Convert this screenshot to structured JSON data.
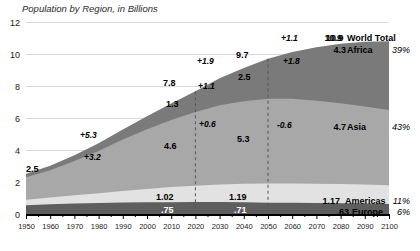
{
  "chart_data": {
    "type": "area",
    "title": "Population by Region, in Billions",
    "xlabel": "",
    "ylabel": "",
    "ylim": [
      0,
      12
    ],
    "xlim": [
      1950,
      2100
    ],
    "grid": true,
    "stacked": true,
    "legend_position": "right",
    "x": [
      1950,
      1960,
      1970,
      1980,
      1990,
      2000,
      2010,
      2020,
      2030,
      2040,
      2050,
      2060,
      2070,
      2080,
      2090,
      2100
    ],
    "yticks": [
      "0",
      "2",
      "4",
      "6",
      "8",
      "10",
      "12"
    ],
    "xticks": [
      "1950",
      "1960",
      "1970",
      "1980",
      "1990",
      "2000",
      "2010",
      "2020",
      "2030",
      "2040",
      "2050",
      "2060",
      "2070",
      "2080",
      "2090",
      "2100"
    ],
    "series": [
      {
        "name": "Europe",
        "color": "#5e5e5e",
        "values": [
          0.55,
          0.61,
          0.66,
          0.69,
          0.72,
          0.73,
          0.74,
          0.75,
          0.75,
          0.74,
          0.71,
          0.7,
          0.68,
          0.67,
          0.65,
          0.63
        ]
      },
      {
        "name": "Americas",
        "color": "#e2e2e2",
        "values": [
          0.34,
          0.42,
          0.51,
          0.61,
          0.72,
          0.84,
          0.94,
          1.02,
          1.09,
          1.15,
          1.19,
          1.21,
          1.21,
          1.2,
          1.19,
          1.17
        ]
      },
      {
        "name": "Asia",
        "color": "#a8a8a8",
        "values": [
          1.4,
          1.7,
          2.14,
          2.64,
          3.21,
          3.73,
          4.19,
          4.6,
          4.95,
          5.16,
          5.3,
          5.29,
          5.19,
          5.05,
          4.88,
          4.7
        ]
      },
      {
        "name": "Africa",
        "color": "#7a7a7a",
        "values": [
          0.23,
          0.28,
          0.36,
          0.48,
          0.63,
          0.81,
          1.04,
          1.3,
          1.69,
          2.08,
          2.5,
          2.93,
          3.34,
          3.72,
          4.04,
          4.3
        ]
      }
    ],
    "totals_labeled": [
      {
        "year": 1950,
        "label": "2.5"
      },
      {
        "year": 2020,
        "label": "7.8"
      },
      {
        "year": 2050,
        "label": "9.7"
      },
      {
        "year": 2100,
        "label": "10.9"
      }
    ],
    "annotations": [
      {
        "text": "+5.3",
        "series": "Asia",
        "period": "1950-2020"
      },
      {
        "text": "+3.2",
        "series": "Asia-lower",
        "period": "1950-2020"
      },
      {
        "text": "+1.9",
        "series": "Africa",
        "period": "2020-2050"
      },
      {
        "text": "+1.1",
        "series": "Africa-upper",
        "period": "2020-2050"
      },
      {
        "text": "+0.6",
        "series": "Asia",
        "period": "2020-2050"
      },
      {
        "text": "+1.1",
        "series": "Total",
        "period": "2050-2100"
      },
      {
        "text": "+1.8",
        "series": "Africa",
        "period": "2050-2100"
      },
      {
        "text": "-0.6",
        "series": "Asia",
        "period": "2050-2100"
      }
    ],
    "point_labels": [
      {
        "year": 2020,
        "series": "Africa",
        "label": "1.3"
      },
      {
        "year": 2020,
        "series": "Asia",
        "label": "4.6"
      },
      {
        "year": 2020,
        "series": "Americas",
        "label": "1.02"
      },
      {
        "year": 2020,
        "series": "Europe",
        "label": ".75"
      },
      {
        "year": 2050,
        "series": "Africa",
        "label": "2.5"
      },
      {
        "year": 2050,
        "series": "Asia",
        "label": "5.3"
      },
      {
        "year": 2050,
        "series": "Americas",
        "label": "1.19"
      },
      {
        "year": 2050,
        "series": "Europe",
        "label": ".71"
      }
    ],
    "legend": [
      {
        "value": "10.9",
        "name": "World Total",
        "pct": ""
      },
      {
        "value": "4.3",
        "name": "Africa",
        "pct": "39%"
      },
      {
        "value": "4.7",
        "name": "Asia",
        "pct": "43%"
      },
      {
        "value": "1.17",
        "name": "Americas",
        "pct": "11%"
      },
      {
        "value": ".63",
        "name": "Europe",
        "pct": "6%"
      }
    ]
  }
}
